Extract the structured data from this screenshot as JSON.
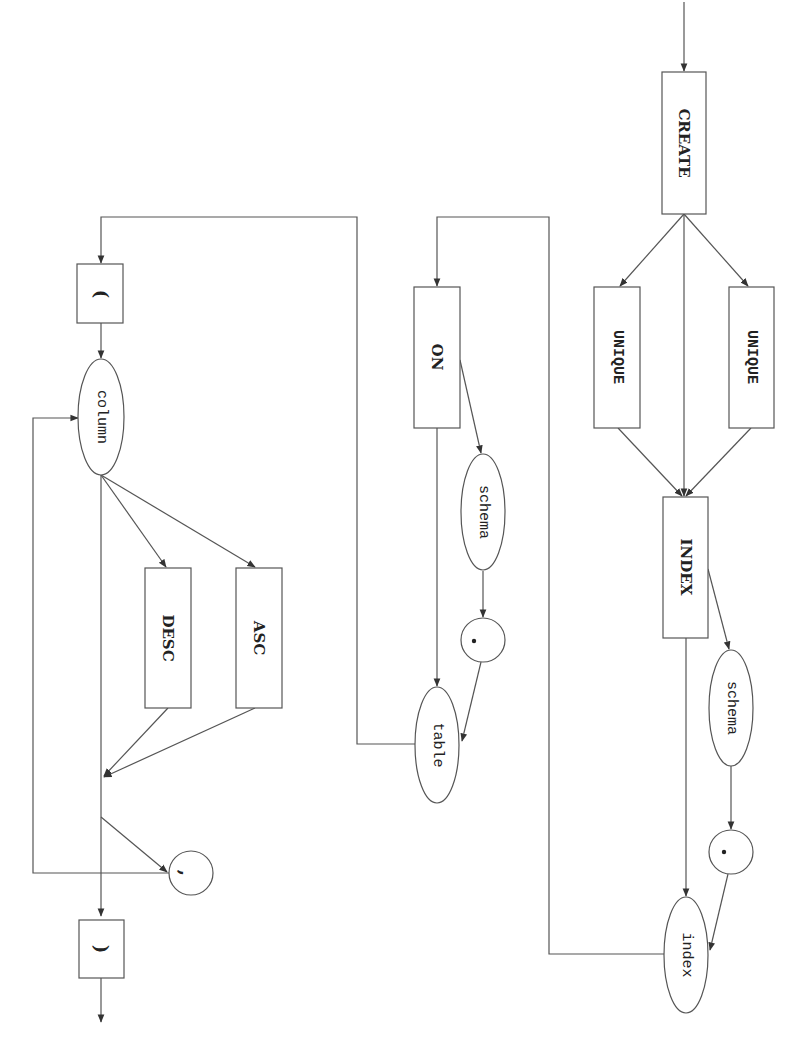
{
  "diagram": {
    "type": "syntax-railroad",
    "orientation": "rotated-90-clockwise",
    "nodes": {
      "create": "CREATE",
      "unique_left": "UNIQUE",
      "unique_right": "UNIQUE",
      "index_kw": "INDEX",
      "schema_index": "schema",
      "dot_index": "·",
      "index_name": "index",
      "on": "ON",
      "schema_table": "schema",
      "dot_table": "·",
      "table": "table",
      "open_paren": "(",
      "column": "column",
      "desc": "DESC",
      "asc": "ASC",
      "comma": ",",
      "close_paren": ")"
    },
    "edges": [
      [
        "start",
        "CREATE"
      ],
      [
        "CREATE",
        "UNIQUE(left)"
      ],
      [
        "CREATE",
        "UNIQUE(right)"
      ],
      [
        "CREATE",
        "INDEX"
      ],
      [
        "UNIQUE(left)",
        "INDEX"
      ],
      [
        "UNIQUE(right)",
        "INDEX"
      ],
      [
        "INDEX",
        "schema"
      ],
      [
        "INDEX",
        "index"
      ],
      [
        "schema",
        "."
      ],
      [
        ".",
        "index"
      ],
      [
        "index",
        "ON"
      ],
      [
        "ON",
        "schema"
      ],
      [
        "ON",
        "table"
      ],
      [
        "schema",
        "."
      ],
      [
        ".",
        "table"
      ],
      [
        "table",
        "("
      ],
      [
        "(",
        "column"
      ],
      [
        "column",
        "DESC"
      ],
      [
        "column",
        "ASC"
      ],
      [
        "column",
        "merge"
      ],
      [
        "DESC",
        "merge"
      ],
      [
        "ASC",
        "merge"
      ],
      [
        "merge",
        ","
      ],
      [
        ",",
        "column"
      ],
      [
        "merge",
        ")"
      ],
      [
        ")",
        "end"
      ]
    ],
    "colors": {
      "stroke": "#555555",
      "text": "#222222",
      "background": "#ffffff"
    }
  }
}
